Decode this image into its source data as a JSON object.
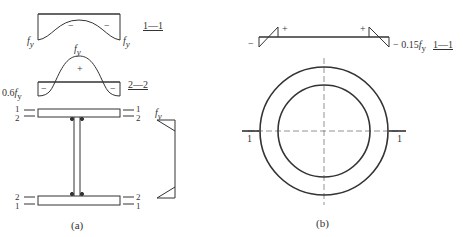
{
  "panel_a": {
    "caption": "(a)",
    "section_1_1": {
      "label": "1—1",
      "left_value": "f_y",
      "right_value": "f_y",
      "left_sign": "−",
      "right_sign": "−"
    },
    "section_2_2": {
      "label": "2—2",
      "peak_value": "f_y",
      "left_value": "0.6f_y",
      "center_sign": "+",
      "left_sign": "−",
      "right_sign": "−"
    },
    "web_stress": {
      "value": "f_y"
    },
    "section_markers": {
      "top_left": [
        "1",
        "2"
      ],
      "top_right": [
        "1",
        "2"
      ],
      "bottom_left": [
        "2",
        "1"
      ],
      "bottom_right": [
        "2",
        "1"
      ]
    }
  },
  "panel_b": {
    "caption": "(b)",
    "stress": {
      "left_sign": "−",
      "left_plus": "+",
      "right_plus": "+",
      "value": "− 0.15f_y",
      "label": "1—1"
    },
    "section_marker_left": "1",
    "section_marker_right": "1"
  },
  "colors": {
    "line": "#333333",
    "dash": "#777777",
    "background": "#ffffff"
  }
}
